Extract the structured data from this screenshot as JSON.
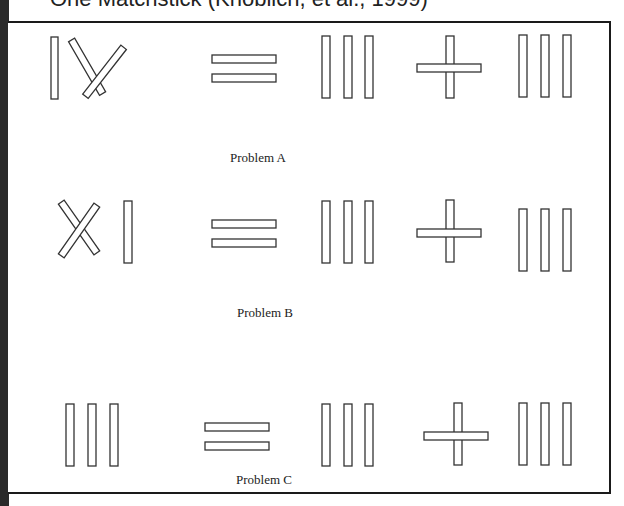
{
  "title": "One Matchstick (Knoblich, et al., 1999)",
  "problems": [
    {
      "label": "Problem A",
      "equation": "IV = III + III"
    },
    {
      "label": "Problem B",
      "equation": "XI = III + III"
    },
    {
      "label": "Problem C",
      "equation": "III = III + III"
    }
  ],
  "colors": {
    "stick_stroke": "#333333",
    "frame": "#1a1a1a",
    "leftbar": "#2a2a2a"
  }
}
